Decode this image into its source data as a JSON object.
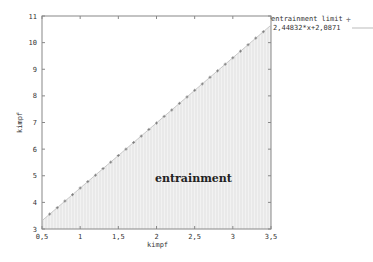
{
  "chart_data": {
    "type": "scatter",
    "title": "",
    "xlabel": "kimpf",
    "ylabel": "kimpf",
    "xlim": [
      0.5,
      3.5
    ],
    "ylim": [
      3,
      11
    ],
    "grid": false,
    "legend_position": "top-right-outside",
    "x_ticks": [
      "0,5",
      "1",
      "1,5",
      "2",
      "2,5",
      "3",
      "3,5"
    ],
    "x_tick_values": [
      0.5,
      1,
      1.5,
      2,
      2.5,
      3,
      3.5
    ],
    "y_ticks": [
      "3",
      "4",
      "5",
      "6",
      "7",
      "8",
      "9",
      "10",
      "11"
    ],
    "y_tick_values": [
      3,
      4,
      5,
      6,
      7,
      8,
      9,
      10,
      11
    ],
    "series": [
      {
        "name": "entrainment limit",
        "style": "points",
        "marker": "+",
        "x": [
          0.6,
          0.7,
          0.8,
          0.9,
          1.0,
          1.1,
          1.2,
          1.3,
          1.4,
          1.5,
          1.6,
          1.7,
          1.8,
          1.9,
          2.0,
          2.1,
          2.2,
          2.3,
          2.4,
          2.5,
          2.6,
          2.7,
          2.8,
          2.9,
          3.0,
          3.1,
          3.2,
          3.3,
          3.4
        ],
        "y": [
          3.56,
          3.8,
          4.05,
          4.29,
          4.54,
          4.78,
          5.02,
          5.27,
          5.51,
          5.76,
          6.0,
          6.25,
          6.49,
          6.74,
          6.98,
          7.23,
          7.47,
          7.72,
          7.96,
          8.21,
          8.45,
          8.7,
          8.94,
          9.19,
          9.43,
          9.68,
          9.92,
          10.17,
          10.41
        ]
      },
      {
        "name": "2.44832*x+2.0871",
        "style": "line",
        "slope": 2.44832,
        "intercept": 2.0871,
        "x": [
          0.5,
          3.5
        ],
        "y": [
          3.311,
          10.656
        ]
      }
    ],
    "annotations": [
      {
        "text": "entrainment",
        "x": 2.0,
        "y": 5.6
      }
    ],
    "fill": {
      "region": "below-line",
      "label": "entrainment",
      "color": "#e4e4e4"
    }
  },
  "legend": {
    "items": [
      {
        "label": "entrainment limit",
        "symbol": "+"
      },
      {
        "label": "2,44832*x+2,0871",
        "symbol": "line"
      }
    ]
  },
  "labels": {
    "xlabel": "kimpf",
    "ylabel": "kimpf",
    "region": "entrainment"
  },
  "colors": {
    "axis": "#888888",
    "points": "#777777",
    "line": "#bbbbbb",
    "fill": "#e6e6e6",
    "hatch": "#d2d2d2"
  }
}
